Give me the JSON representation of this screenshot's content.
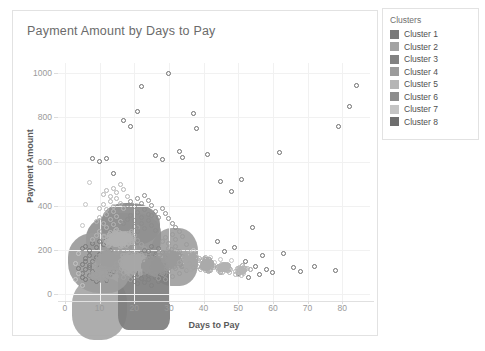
{
  "chart_card": {
    "title": "Payment Amount by Days to Pay"
  },
  "legend": {
    "title": "Clusters",
    "items": [
      {
        "label": "Cluster 1",
        "color": "#7a7a7a"
      },
      {
        "label": "Cluster 2",
        "color": "#a3a3a3"
      },
      {
        "label": "Cluster 3",
        "color": "#828282"
      },
      {
        "label": "Cluster 4",
        "color": "#9c9c9c"
      },
      {
        "label": "Cluster 5",
        "color": "#b5b5b5"
      },
      {
        "label": "Cluster 6",
        "color": "#8d8d8d"
      },
      {
        "label": "Cluster 7",
        "color": "#c4c4c4"
      },
      {
        "label": "Cluster 8",
        "color": "#6e6e6e"
      }
    ]
  },
  "chart_data": {
    "type": "scatter",
    "title": "Payment Amount by Days to Pay",
    "xlabel": "Days to Pay",
    "ylabel": "Payment Amount",
    "xlim": [
      -2,
      88
    ],
    "ylim": [
      -30,
      1045
    ],
    "xticks": [
      0,
      10,
      20,
      30,
      40,
      50,
      60,
      70,
      80
    ],
    "yticks": [
      0,
      200,
      400,
      600,
      800,
      1000
    ],
    "grid": true,
    "legend_position": "outside-right",
    "marker": {
      "shape": "circle",
      "filled": false,
      "size_px": 5
    },
    "series": [
      {
        "name": "Cluster 1",
        "color": "#7a7a7a",
        "points": [
          [
            5,
            95
          ],
          [
            6,
            112
          ],
          [
            7,
            130
          ],
          [
            8,
            104
          ],
          [
            9,
            88
          ],
          [
            10,
            121
          ],
          [
            11,
            140
          ],
          [
            12,
            97
          ],
          [
            6,
            160
          ],
          [
            7,
            175
          ],
          [
            8,
            150
          ],
          [
            9,
            168
          ],
          [
            10,
            182
          ],
          [
            11,
            155
          ],
          [
            12,
            190
          ],
          [
            13,
            133
          ],
          [
            5,
            205
          ],
          [
            6,
            218
          ],
          [
            7,
            196
          ],
          [
            8,
            230
          ],
          [
            9,
            212
          ],
          [
            10,
            240
          ],
          [
            11,
            225
          ],
          [
            12,
            252
          ],
          [
            13,
            198
          ],
          [
            14,
            165
          ],
          [
            5,
            78
          ],
          [
            6,
            66
          ],
          [
            7,
            85
          ],
          [
            8,
            72
          ],
          [
            9,
            58
          ],
          [
            10,
            69
          ],
          [
            11,
            80
          ],
          [
            12,
            62
          ],
          [
            13,
            91
          ],
          [
            14,
            105
          ],
          [
            4,
            118
          ],
          [
            5,
            136
          ],
          [
            6,
            148
          ],
          [
            7,
            122
          ]
        ]
      },
      {
        "name": "Cluster 2",
        "color": "#a3a3a3",
        "points": [
          [
            14,
            120
          ],
          [
            15,
            138
          ],
          [
            16,
            155
          ],
          [
            17,
            142
          ],
          [
            18,
            128
          ],
          [
            19,
            160
          ],
          [
            20,
            175
          ],
          [
            21,
            150
          ],
          [
            15,
            190
          ],
          [
            16,
            205
          ],
          [
            17,
            220
          ],
          [
            18,
            198
          ],
          [
            19,
            235
          ],
          [
            20,
            212
          ],
          [
            21,
            245
          ],
          [
            22,
            188
          ],
          [
            14,
            95
          ],
          [
            15,
            82
          ],
          [
            16,
            108
          ],
          [
            17,
            75
          ],
          [
            18,
            92
          ],
          [
            19,
            68
          ],
          [
            20,
            110
          ],
          [
            21,
            85
          ],
          [
            22,
            130
          ],
          [
            23,
            145
          ],
          [
            24,
            118
          ],
          [
            25,
            100
          ],
          [
            16,
            260
          ],
          [
            17,
            275
          ],
          [
            18,
            250
          ],
          [
            19,
            288
          ],
          [
            20,
            265
          ],
          [
            21,
            300
          ],
          [
            22,
            225
          ],
          [
            23,
            205
          ],
          [
            24,
            180
          ],
          [
            25,
            162
          ]
        ]
      },
      {
        "name": "Cluster 3",
        "color": "#828282",
        "points": [
          [
            20,
            60
          ],
          [
            21,
            48
          ],
          [
            22,
            72
          ],
          [
            23,
            55
          ],
          [
            24,
            66
          ],
          [
            25,
            42
          ],
          [
            26,
            78
          ],
          [
            27,
            58
          ],
          [
            20,
            88
          ],
          [
            21,
            102
          ],
          [
            22,
            95
          ],
          [
            23,
            110
          ],
          [
            24,
            84
          ],
          [
            25,
            120
          ],
          [
            26,
            98
          ],
          [
            27,
            130
          ],
          [
            21,
            140
          ],
          [
            22,
            155
          ],
          [
            23,
            148
          ],
          [
            24,
            165
          ],
          [
            25,
            135
          ],
          [
            26,
            172
          ],
          [
            27,
            158
          ],
          [
            28,
            145
          ],
          [
            22,
            185
          ],
          [
            23,
            200
          ],
          [
            24,
            192
          ],
          [
            25,
            215
          ],
          [
            26,
            178
          ],
          [
            27,
            205
          ],
          [
            28,
            188
          ],
          [
            29,
            168
          ]
        ]
      },
      {
        "name": "Cluster 4",
        "color": "#9c9c9c",
        "points": [
          [
            26,
            110
          ],
          [
            27,
            125
          ],
          [
            28,
            140
          ],
          [
            29,
            118
          ],
          [
            30,
            152
          ],
          [
            31,
            135
          ],
          [
            32,
            160
          ],
          [
            33,
            142
          ],
          [
            27,
            175
          ],
          [
            28,
            190
          ],
          [
            29,
            168
          ],
          [
            30,
            205
          ],
          [
            31,
            182
          ],
          [
            32,
            218
          ],
          [
            33,
            195
          ],
          [
            34,
            172
          ],
          [
            26,
            88
          ],
          [
            27,
            72
          ],
          [
            28,
            95
          ],
          [
            29,
            65
          ],
          [
            30,
            102
          ],
          [
            31,
            80
          ],
          [
            32,
            115
          ],
          [
            33,
            92
          ],
          [
            34,
            128
          ],
          [
            35,
            108
          ],
          [
            36,
            140
          ],
          [
            37,
            120
          ],
          [
            28,
            240
          ],
          [
            29,
            258
          ],
          [
            30,
            230
          ],
          [
            31,
            272
          ],
          [
            32,
            248
          ],
          [
            33,
            285
          ],
          [
            34,
            262
          ],
          [
            35,
            225
          ]
        ]
      },
      {
        "name": "Cluster 5",
        "color": "#b5b5b5",
        "points": [
          [
            8,
            250
          ],
          [
            9,
            268
          ],
          [
            10,
            285
          ],
          [
            11,
            262
          ],
          [
            12,
            300
          ],
          [
            13,
            278
          ],
          [
            14,
            315
          ],
          [
            15,
            292
          ],
          [
            9,
            330
          ],
          [
            10,
            348
          ],
          [
            11,
            322
          ],
          [
            12,
            360
          ],
          [
            13,
            338
          ],
          [
            14,
            375
          ],
          [
            15,
            352
          ],
          [
            16,
            330
          ],
          [
            10,
            390
          ],
          [
            11,
            405
          ],
          [
            12,
            382
          ],
          [
            13,
            420
          ],
          [
            14,
            398
          ],
          [
            15,
            435
          ],
          [
            16,
            412
          ],
          [
            17,
            388
          ],
          [
            11,
            450
          ],
          [
            12,
            468
          ],
          [
            13,
            442
          ],
          [
            14,
            480
          ],
          [
            15,
            458
          ],
          [
            16,
            495
          ],
          [
            17,
            472
          ],
          [
            18,
            440
          ]
        ]
      },
      {
        "name": "Cluster 6",
        "color": "#8d8d8d",
        "points": [
          [
            17,
            320
          ],
          [
            18,
            338
          ],
          [
            19,
            355
          ],
          [
            20,
            332
          ],
          [
            21,
            370
          ],
          [
            22,
            348
          ],
          [
            23,
            385
          ],
          [
            24,
            362
          ],
          [
            18,
            400
          ],
          [
            19,
            418
          ],
          [
            20,
            395
          ],
          [
            21,
            432
          ],
          [
            22,
            410
          ],
          [
            23,
            448
          ],
          [
            24,
            425
          ],
          [
            25,
            402
          ],
          [
            19,
            290
          ],
          [
            20,
            308
          ],
          [
            21,
            282
          ],
          [
            22,
            320
          ],
          [
            23,
            298
          ],
          [
            24,
            335
          ],
          [
            25,
            312
          ],
          [
            26,
            288
          ],
          [
            25,
            355
          ],
          [
            26,
            372
          ],
          [
            27,
            348
          ],
          [
            28,
            390
          ],
          [
            29,
            365
          ],
          [
            30,
            342
          ],
          [
            31,
            318
          ],
          [
            32,
            300
          ]
        ]
      },
      {
        "name": "Cluster 7",
        "color": "#c4c4c4",
        "points": [
          [
            3,
            140
          ],
          [
            4,
            185
          ],
          [
            5,
            310
          ],
          [
            6,
            405
          ],
          [
            7,
            505
          ],
          [
            4,
            95
          ],
          [
            3,
            65
          ],
          [
            5,
            42
          ],
          [
            33,
            165
          ],
          [
            34,
            148
          ],
          [
            35,
            130
          ],
          [
            36,
            185
          ],
          [
            37,
            200
          ],
          [
            38,
            172
          ],
          [
            39,
            155
          ],
          [
            40,
            138
          ],
          [
            41,
            120
          ],
          [
            42,
            165
          ],
          [
            43,
            142
          ],
          [
            44,
            118
          ],
          [
            45,
            158
          ],
          [
            46,
            135
          ],
          [
            47,
            110
          ],
          [
            48,
            152
          ]
        ]
      },
      {
        "name": "Cluster 8",
        "color": "#6e6e6e",
        "points": [
          [
            8,
            612
          ],
          [
            10,
            600
          ],
          [
            12,
            615
          ],
          [
            14,
            545
          ],
          [
            17,
            785
          ],
          [
            19,
            760
          ],
          [
            21,
            825
          ],
          [
            22,
            938
          ],
          [
            26,
            625
          ],
          [
            28,
            610
          ],
          [
            30,
            998
          ],
          [
            33,
            645
          ],
          [
            34,
            620
          ],
          [
            37,
            815
          ],
          [
            38,
            748
          ],
          [
            41,
            632
          ],
          [
            45,
            508
          ],
          [
            48,
            465
          ],
          [
            51,
            520
          ],
          [
            54,
            300
          ],
          [
            57,
            175
          ],
          [
            62,
            640
          ],
          [
            63,
            185
          ],
          [
            68,
            105
          ],
          [
            72,
            125
          ],
          [
            78,
            108
          ],
          [
            79,
            760
          ],
          [
            82,
            848
          ],
          [
            84,
            945
          ],
          [
            49,
            210
          ],
          [
            52,
            150
          ],
          [
            55,
            128
          ],
          [
            58,
            112
          ],
          [
            44,
            238
          ],
          [
            46,
            195
          ],
          [
            50,
            92
          ],
          [
            53,
            78
          ],
          [
            56,
            88
          ],
          [
            60,
            100
          ],
          [
            66,
            120
          ]
        ]
      }
    ]
  }
}
